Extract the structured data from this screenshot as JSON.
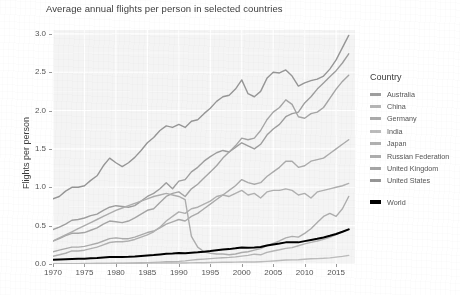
{
  "chart_data": {
    "type": "line",
    "title": "Average annual flights per person in selected countries",
    "xlabel": "",
    "ylabel": "Flights per person",
    "xlim": [
      1970,
      2018
    ],
    "ylim": [
      0.0,
      3.05
    ],
    "grid": true,
    "legend_position": "right",
    "legend_title": "Country",
    "x_ticks": [
      "1970",
      "1975",
      "1980",
      "1985",
      "1990",
      "1995",
      "2000",
      "2005",
      "2010",
      "2015"
    ],
    "x_tick_values": [
      1970,
      1975,
      1980,
      1985,
      1990,
      1995,
      2000,
      2005,
      2010,
      2015
    ],
    "y_ticks": [
      "0.0",
      "0.5",
      "1.0",
      "1.5",
      "2.0",
      "2.5",
      "3.0"
    ],
    "y_tick_values": [
      0.0,
      0.5,
      1.0,
      1.5,
      2.0,
      2.5,
      3.0
    ],
    "x": [
      1970,
      1971,
      1972,
      1973,
      1974,
      1975,
      1976,
      1977,
      1978,
      1979,
      1980,
      1981,
      1982,
      1983,
      1984,
      1985,
      1986,
      1987,
      1988,
      1989,
      1990,
      1991,
      1992,
      1993,
      1994,
      1995,
      1996,
      1997,
      1998,
      1999,
      2000,
      2001,
      2002,
      2003,
      2004,
      2005,
      2006,
      2007,
      2008,
      2009,
      2010,
      2011,
      2012,
      2013,
      2014,
      2015,
      2016,
      2017
    ],
    "series": [
      {
        "name": "United States",
        "color": "#969696",
        "width": 1.4,
        "values": [
          0.85,
          0.88,
          0.95,
          1.0,
          1.0,
          1.02,
          1.09,
          1.15,
          1.28,
          1.38,
          1.32,
          1.27,
          1.32,
          1.39,
          1.48,
          1.58,
          1.65,
          1.74,
          1.8,
          1.78,
          1.82,
          1.78,
          1.86,
          1.88,
          1.96,
          2.03,
          2.12,
          2.18,
          2.2,
          2.28,
          2.4,
          2.22,
          2.18,
          2.25,
          2.42,
          2.5,
          2.49,
          2.53,
          2.45,
          2.32,
          2.36,
          2.39,
          2.41,
          2.45,
          2.54,
          2.66,
          2.82,
          2.98
        ]
      },
      {
        "name": "Australia",
        "color": "#9e9e9e",
        "width": 1.4,
        "values": [
          0.45,
          0.48,
          0.52,
          0.57,
          0.58,
          0.6,
          0.63,
          0.65,
          0.7,
          0.74,
          0.76,
          0.75,
          0.74,
          0.76,
          0.82,
          0.88,
          0.92,
          0.98,
          1.06,
          0.98,
          1.08,
          1.1,
          1.2,
          1.26,
          1.34,
          1.4,
          1.45,
          1.48,
          1.46,
          1.52,
          1.58,
          1.54,
          1.5,
          1.56,
          1.68,
          1.76,
          1.82,
          1.92,
          1.96,
          1.98,
          2.1,
          2.18,
          2.28,
          2.36,
          2.44,
          2.52,
          2.62,
          2.74
        ]
      },
      {
        "name": "United Kingdom",
        "color": "#a5a5a5",
        "width": 1.4,
        "values": [
          0.3,
          0.33,
          0.37,
          0.4,
          0.4,
          0.41,
          0.44,
          0.47,
          0.52,
          0.56,
          0.55,
          0.54,
          0.56,
          0.6,
          0.65,
          0.7,
          0.72,
          0.8,
          0.88,
          0.92,
          0.94,
          0.88,
          0.98,
          1.04,
          1.12,
          1.2,
          1.28,
          1.38,
          1.46,
          1.54,
          1.64,
          1.62,
          1.64,
          1.74,
          1.88,
          1.98,
          2.04,
          2.14,
          2.08,
          1.92,
          1.9,
          1.96,
          1.98,
          2.04,
          2.16,
          2.28,
          2.38,
          2.46
        ]
      },
      {
        "name": "Germany",
        "color": "#ababab",
        "width": 1.4,
        "values": [
          0.16,
          0.18,
          0.2,
          0.22,
          0.22,
          0.23,
          0.25,
          0.27,
          0.3,
          0.33,
          0.34,
          0.33,
          0.33,
          0.35,
          0.38,
          0.41,
          0.43,
          0.47,
          0.52,
          0.55,
          0.58,
          0.56,
          0.62,
          0.66,
          0.72,
          0.78,
          0.84,
          0.9,
          0.96,
          1.02,
          1.1,
          1.06,
          1.04,
          1.06,
          1.14,
          1.2,
          1.26,
          1.34,
          1.34,
          1.26,
          1.28,
          1.34,
          1.36,
          1.38,
          1.44,
          1.5,
          1.56,
          1.62
        ]
      },
      {
        "name": "Japan",
        "color": "#b0b0b0",
        "width": 1.4,
        "values": [
          0.1,
          0.12,
          0.14,
          0.17,
          0.17,
          0.18,
          0.2,
          0.22,
          0.25,
          0.28,
          0.29,
          0.29,
          0.3,
          0.32,
          0.35,
          0.38,
          0.42,
          0.48,
          0.56,
          0.62,
          0.68,
          0.66,
          0.72,
          0.74,
          0.78,
          0.82,
          0.88,
          0.9,
          0.88,
          0.92,
          0.96,
          0.9,
          0.92,
          0.86,
          0.94,
          0.96,
          0.96,
          0.98,
          0.96,
          0.9,
          0.92,
          0.86,
          0.94,
          0.96,
          0.98,
          1.0,
          1.02,
          1.05
        ]
      },
      {
        "name": "Russian Federation",
        "color": "#adadad",
        "width": 1.4,
        "values": [
          0.3,
          0.34,
          0.38,
          0.42,
          0.46,
          0.5,
          0.54,
          0.58,
          0.62,
          0.66,
          0.7,
          0.73,
          0.76,
          0.79,
          0.82,
          0.85,
          0.88,
          0.9,
          0.92,
          0.9,
          0.88,
          0.84,
          0.36,
          0.22,
          0.16,
          0.14,
          0.13,
          0.13,
          0.12,
          0.13,
          0.15,
          0.16,
          0.18,
          0.2,
          0.24,
          0.27,
          0.3,
          0.34,
          0.36,
          0.35,
          0.4,
          0.46,
          0.54,
          0.62,
          0.66,
          0.62,
          0.72,
          0.88
        ]
      },
      {
        "name": "China",
        "color": "#b5b5b5",
        "width": 1.4,
        "values": [
          0.002,
          0.002,
          0.003,
          0.003,
          0.004,
          0.004,
          0.005,
          0.006,
          0.007,
          0.008,
          0.009,
          0.01,
          0.012,
          0.014,
          0.016,
          0.018,
          0.021,
          0.025,
          0.029,
          0.03,
          0.034,
          0.041,
          0.05,
          0.058,
          0.064,
          0.07,
          0.076,
          0.082,
          0.086,
          0.093,
          0.102,
          0.112,
          0.128,
          0.12,
          0.152,
          0.17,
          0.186,
          0.204,
          0.214,
          0.238,
          0.262,
          0.282,
          0.3,
          0.322,
          0.348,
          0.382,
          0.42,
          0.452
        ]
      },
      {
        "name": "India",
        "color": "#bcbcbc",
        "width": 1.4,
        "values": [
          0.004,
          0.004,
          0.005,
          0.005,
          0.005,
          0.006,
          0.006,
          0.007,
          0.007,
          0.008,
          0.008,
          0.008,
          0.009,
          0.009,
          0.01,
          0.011,
          0.012,
          0.013,
          0.014,
          0.014,
          0.015,
          0.014,
          0.015,
          0.016,
          0.017,
          0.019,
          0.021,
          0.022,
          0.023,
          0.024,
          0.026,
          0.026,
          0.027,
          0.03,
          0.034,
          0.039,
          0.045,
          0.052,
          0.054,
          0.056,
          0.062,
          0.068,
          0.07,
          0.074,
          0.08,
          0.09,
          0.1,
          0.112
        ]
      },
      {
        "name": "World",
        "color": "#000000",
        "width": 2.0,
        "values": [
          0.055,
          0.058,
          0.062,
          0.066,
          0.068,
          0.07,
          0.074,
          0.078,
          0.084,
          0.09,
          0.092,
          0.092,
          0.094,
          0.098,
          0.104,
          0.11,
          0.116,
          0.124,
          0.132,
          0.136,
          0.142,
          0.14,
          0.148,
          0.152,
          0.16,
          0.168,
          0.178,
          0.188,
          0.194,
          0.204,
          0.216,
          0.212,
          0.214,
          0.222,
          0.24,
          0.254,
          0.266,
          0.282,
          0.284,
          0.282,
          0.298,
          0.314,
          0.328,
          0.346,
          0.368,
          0.392,
          0.42,
          0.452
        ]
      }
    ]
  },
  "legend": {
    "title": "Country",
    "items": [
      {
        "label": "Australia",
        "color": "#9e9e9e"
      },
      {
        "label": "China",
        "color": "#b5b5b5"
      },
      {
        "label": "Germany",
        "color": "#ababab"
      },
      {
        "label": "India",
        "color": "#bcbcbc"
      },
      {
        "label": "Japan",
        "color": "#b0b0b0"
      },
      {
        "label": "Russian Federation",
        "color": "#adadad"
      },
      {
        "label": "United Kingdom",
        "color": "#a5a5a5"
      },
      {
        "label": "United States",
        "color": "#969696"
      }
    ],
    "world": {
      "label": "World",
      "color": "#000000"
    }
  }
}
